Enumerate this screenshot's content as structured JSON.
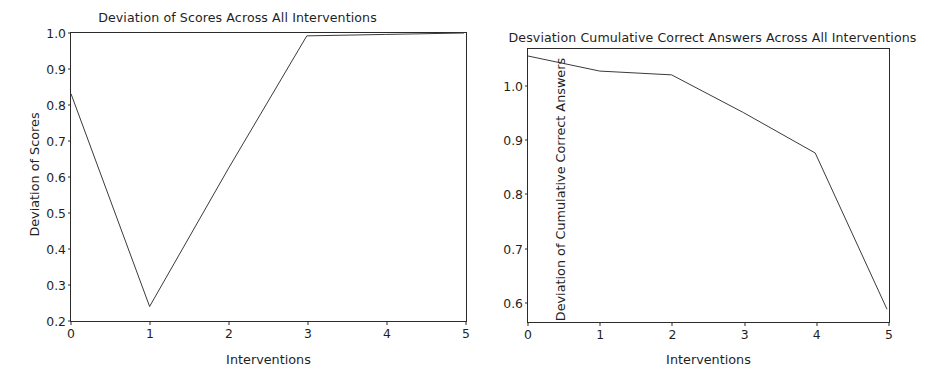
{
  "figure": {
    "background": "#ffffff",
    "line_color": "#3a3a3a",
    "axis_color": "#2b2b2b",
    "text_color": "#1f1f1f"
  },
  "chart_data": [
    {
      "type": "line",
      "title": "Deviation of Scores Across All Interventions",
      "xlabel": "Interventions",
      "ylabel": "Deviation of Scores",
      "x": [
        0,
        1,
        2,
        3,
        4,
        5
      ],
      "values": [
        0.83,
        0.235,
        0.62,
        0.992,
        0.996,
        1.0
      ],
      "xticks": [
        "0",
        "1",
        "2",
        "3",
        "4",
        "5"
      ],
      "yticks": [
        "0.2",
        "0.3",
        "0.4",
        "0.5",
        "0.6",
        "0.7",
        "0.8",
        "0.9",
        "1.0"
      ],
      "xlim": [
        0,
        5
      ],
      "ylim": [
        0.2,
        1.0
      ],
      "grid": false,
      "legend": false
    },
    {
      "type": "line",
      "title": "Desviation Cumulative Correct Answers Across All Interventions",
      "xlabel": "Interventions",
      "ylabel": "Deviation of Cumulative Correct Answers",
      "x": [
        0,
        1,
        2,
        3,
        4,
        5
      ],
      "values": [
        1.055,
        1.027,
        1.02,
        0.95,
        0.875,
        0.585
      ],
      "xticks": [
        "0",
        "1",
        "2",
        "3",
        "4",
        "5"
      ],
      "yticks": [
        "0.6",
        "0.7",
        "0.8",
        "0.9",
        "1.0"
      ],
      "xlim": [
        0,
        5
      ],
      "ylim": [
        0.565,
        1.068
      ],
      "grid": false,
      "legend": false
    }
  ]
}
